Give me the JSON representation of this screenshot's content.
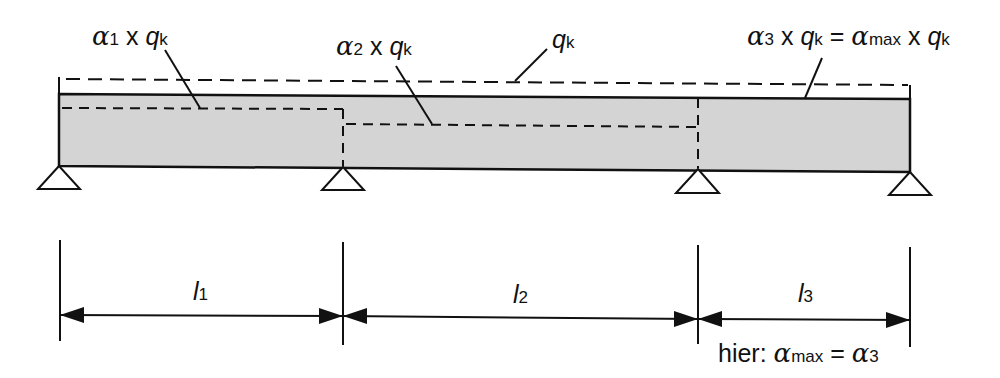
{
  "diagram": {
    "colors": {
      "beam_fill": "#d4d4d4",
      "stroke": "#111111",
      "background": "#ffffff"
    },
    "labels": {
      "alpha1": {
        "greek": "α",
        "index": "1",
        "times": " x ",
        "q": "q",
        "q_sub": "k"
      },
      "alpha2": {
        "greek": "α",
        "index": "2",
        "times": " x ",
        "q": "q",
        "q_sub": "k"
      },
      "qk": {
        "q": "q",
        "q_sub": "k"
      },
      "alpha3": {
        "greek": "α",
        "index": "3",
        "times": " x ",
        "q": "q",
        "q_sub": "k",
        "equals": " = ",
        "greek_max": "α",
        "max_sub": "max",
        "times2": " x ",
        "q2": "q",
        "q2_sub": "k"
      }
    },
    "spans": [
      {
        "name": "l",
        "index": "1"
      },
      {
        "name": "l",
        "index": "2"
      },
      {
        "name": "l",
        "index": "3"
      }
    ],
    "note": {
      "prefix": "hier: ",
      "greek": "α",
      "max_sub": "max",
      "equals": " = ",
      "greek2": "α",
      "index": "3"
    },
    "supports": 4
  }
}
